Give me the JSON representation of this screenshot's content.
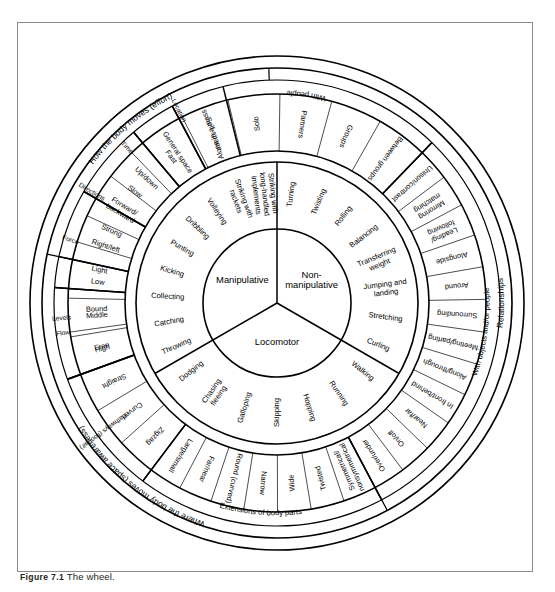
{
  "figure": {
    "label": "Figure 7.1",
    "caption": "The wheel.",
    "title": "The wheel"
  },
  "wheel": {
    "center_rings": [
      {
        "name": "Manipulative"
      },
      {
        "name": "Non-manipulative"
      },
      {
        "name": "Locomotor"
      }
    ],
    "skills_ring": {
      "manipulative": [
        "Striking with long-handled implements",
        "Striking with rackets",
        "Volleying",
        "Dribbling",
        "Punting",
        "Kicking",
        "Collecting",
        "Catching",
        "Throwing"
      ],
      "non_manipulative": [
        "Turning",
        "Twisting",
        "Rolling",
        "Balancing",
        "Transferring weight",
        "Jumping and landing",
        "Stretching",
        "Curling"
      ],
      "locomotor": [
        "Walking",
        "Running",
        "Hopping",
        "Skipping",
        "Galloping",
        "Chasing fleeing",
        "Dodging"
      ]
    },
    "quadrants": [
      {
        "name": "How the body moves (effort)",
        "groups": [
          {
            "name": "Time",
            "items": [
              "Fast",
              "Slow"
            ]
          },
          {
            "name": "Force",
            "items": [
              "Strong",
              "Light"
            ]
          },
          {
            "name": "Flow",
            "items": [
              "Bound",
              "Free"
            ]
          }
        ]
      },
      {
        "name": "Where the body moves (space awareness)",
        "groups": [
          {
            "name": "Location",
            "items": [
              "Self-space",
              "General space"
            ]
          },
          {
            "name": "Directions",
            "items": [
              "Up/down",
              "Forward/backward",
              "Right/left"
            ]
          },
          {
            "name": "Levels",
            "items": [
              "Low",
              "Middle",
              "High"
            ]
          },
          {
            "name": "Pathways (floor/air)",
            "items": [
              "Straight",
              "Curved",
              "Zigzag"
            ]
          },
          {
            "name": "Extensions of body parts",
            "items": [
              "Large/small",
              "Far/near"
            ]
          }
        ]
      },
      {
        "name": "Relationships",
        "groups": [
          {
            "name": "With people",
            "items": [
              "Alone in a mass",
              "Solo",
              "Partners",
              "Groups",
              "Between groups"
            ]
          },
          {
            "name": "With objects and/or people",
            "items": [
              "Unison/contrast",
              "Mirroring matching",
              "Leading/following",
              "Alongside",
              "Around",
              "Surrounding",
              "Meeting/parting",
              "Along/through",
              "In front/behind",
              "Near/far",
              "On/off",
              "Over/under"
            ]
          },
          {
            "name": "Body shapes",
            "items": [
              "Symmetrical/nonsymmetrical",
              "Twisted",
              "Wide",
              "Narrow",
              "Round (curved)"
            ]
          }
        ]
      }
    ]
  }
}
